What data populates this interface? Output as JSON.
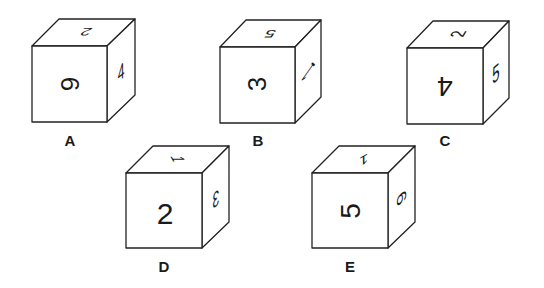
{
  "figure": {
    "cubes": [
      {
        "label": "A",
        "front": "6",
        "front_orientation": "rotated-90-cw",
        "top": "2",
        "top_orientation": "upside-down",
        "right": "4",
        "right_orientation": "upright-skewed"
      },
      {
        "label": "B",
        "front": "3",
        "front_orientation": "rotated-90-ccw",
        "top": "5",
        "top_orientation": "upside-down",
        "right": "1",
        "right_orientation": "rotated"
      },
      {
        "label": "C",
        "front": "4",
        "front_orientation": "upside-down",
        "top": "2",
        "top_orientation": "rotated-90",
        "right": "5",
        "right_orientation": "upright-skewed"
      },
      {
        "label": "D",
        "front": "2",
        "front_orientation": "upright",
        "top": "1",
        "top_orientation": "rotated-90",
        "right": "3",
        "right_orientation": "mirrored"
      },
      {
        "label": "E",
        "front": "5",
        "front_orientation": "rotated-90-ccw",
        "top": "1",
        "top_orientation": "rotated",
        "right": "6",
        "right_orientation": "rotated-90-cw"
      }
    ]
  }
}
